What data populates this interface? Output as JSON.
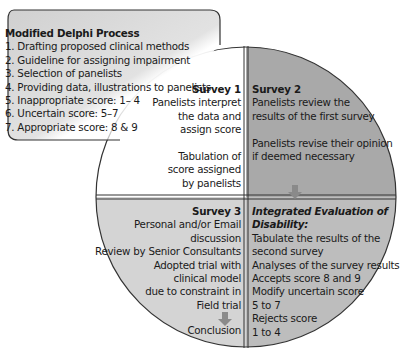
{
  "callout": {
    "title": "Modified Delphi Process",
    "items": [
      "1. Drafting proposed clinical methods",
      "2. Guideline for assigning impairment",
      "3. Selection of panelists",
      "4. Providing data, illustrations to panelists",
      "5. Inappropriate score: 1– 4",
      "6. Uncertain score: 5–7",
      "7. Appropriate score: 8 & 9"
    ]
  },
  "quadrants": {
    "survey1": {
      "title": "Survey 1",
      "lines": [
        "Panelists interpret",
        "the data and",
        "assign score",
        "",
        "Tabulation of",
        "score assigned",
        "by panelists"
      ]
    },
    "survey2": {
      "title": "Survey 2",
      "lines": [
        "Panelists review the",
        "results of the first survey",
        "",
        "Panelists revise their opinion",
        "if deemed necessary"
      ]
    },
    "survey3": {
      "title": "Survey 3",
      "lines": [
        "Personal and/or Email",
        "discussion",
        "Review by Senior Consultants",
        "Adopted trial with",
        "clinical model",
        "due to constraint in",
        "Field trial"
      ],
      "conclusion": "Conclusion"
    },
    "integrated": {
      "title_line1": "Integrated Evaluation of",
      "title_line2": "Disability:",
      "lines": [
        "Tabulate the results of the",
        "second survey",
        "Analyses of the survey results",
        "Accepts score 8 and 9",
        "Modify uncertain score",
        "5 to 7",
        "Rejects score",
        "1 to 4"
      ]
    }
  },
  "colors": {
    "survey1_fill": "#ffffff",
    "survey2_fill": "#a9a9a9",
    "bottom_fill": "#d4d4d4",
    "callout_fill": "#d9d9d9",
    "outline": "#333333",
    "arrow": "#8a8a8a"
  }
}
